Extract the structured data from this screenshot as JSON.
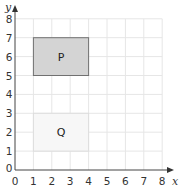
{
  "figure": {
    "x_axis_label": "x",
    "y_axis_label": "y",
    "x_ticks": [
      "0",
      "1",
      "2",
      "3",
      "4",
      "5",
      "6",
      "7",
      "8"
    ],
    "y_ticks": [
      "0",
      "1",
      "2",
      "3",
      "4",
      "5",
      "6",
      "7",
      "8"
    ],
    "grid_color": "#e6e6e6",
    "axis_color": "#444444",
    "shapes": [
      {
        "label": "P",
        "x1": 1,
        "y1": 5,
        "x2": 4,
        "y2": 7,
        "fill": "#d4d4d4",
        "stroke": "#707070"
      },
      {
        "label": "Q",
        "x1": 1,
        "y1": 1,
        "x2": 4,
        "y2": 3,
        "fill": "#f7f7f7",
        "stroke": "#dddddd"
      }
    ]
  }
}
